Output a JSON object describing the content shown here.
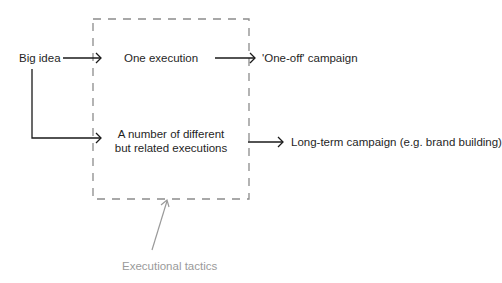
{
  "diagram": {
    "nodes": {
      "big_idea": "Big idea",
      "one_execution": "One execution",
      "multiple_executions_line1": "A number of different",
      "multiple_executions_line2": "but related executions",
      "one_off_campaign": "'One-off' campaign",
      "long_term_campaign": "Long-term campaign (e.g. brand building)",
      "executional_tactics": "Executional tactics"
    },
    "edges": [
      {
        "from": "Big idea",
        "to": "One execution"
      },
      {
        "from": "Big idea",
        "to": "A number of different but related executions"
      },
      {
        "from": "One execution",
        "to": "'One-off' campaign"
      },
      {
        "from": "A number of different but related executions",
        "to": "Long-term campaign (e.g. brand building)"
      },
      {
        "from": "Executional tactics",
        "to": "dashed box (executions)"
      }
    ],
    "colors": {
      "line": "#1a1a1a",
      "dashed_box": "#8c8c8c",
      "annotation": "#9a9a9a"
    }
  }
}
